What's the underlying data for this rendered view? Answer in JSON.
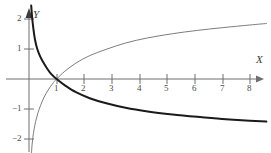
{
  "figure": {
    "background": "#ffffff",
    "x_axis_name": "X",
    "y_axis_name": "Y"
  },
  "chart_data": {
    "type": "line",
    "title": "",
    "xlabel": "X",
    "ylabel": "Y",
    "xlim": [
      -0.15,
      8.8
    ],
    "ylim": [
      -2.6,
      2.4
    ],
    "grid": false,
    "legend": null,
    "axis_arrows": [
      "x-positive",
      "y-positive"
    ],
    "x_ticks": [
      1,
      2,
      3,
      4,
      5,
      6,
      7,
      8
    ],
    "x_tick_labels": [
      "1",
      "2",
      "3",
      "4",
      "5",
      "6",
      "7",
      "8"
    ],
    "y_ticks": [
      -2,
      -1,
      1,
      2
    ],
    "y_tick_labels": [
      "−2",
      "−1",
      "1",
      "2"
    ],
    "series": [
      {
        "name": "decreasing-logarithm",
        "color": "#1a1a1a",
        "width": 2.0,
        "note": "thick black curve, decreasing, passes through (1,0)",
        "x": [
          0.08,
          0.1,
          0.13,
          0.17,
          0.22,
          0.3,
          0.4,
          0.5,
          0.65,
          0.8,
          1.0,
          1.3,
          1.7,
          2.2,
          2.8,
          3.5,
          4.3,
          5.2,
          6.1,
          7.0,
          8.0,
          8.6
        ],
        "y": [
          2.45,
          2.2,
          1.9,
          1.6,
          1.3,
          1.0,
          0.76,
          0.58,
          0.36,
          0.17,
          0.0,
          -0.21,
          -0.44,
          -0.64,
          -0.81,
          -0.96,
          -1.08,
          -1.18,
          -1.26,
          -1.33,
          -1.39,
          -1.42
        ]
      },
      {
        "name": "increasing-logarithm",
        "color": "#6e6e6e",
        "width": 0.9,
        "note": "thin gray curve, increasing, passes through (1,0)",
        "x": [
          0.09,
          0.11,
          0.14,
          0.18,
          0.24,
          0.32,
          0.42,
          0.55,
          0.7,
          0.85,
          1.0,
          1.3,
          1.7,
          2.2,
          2.8,
          3.5,
          4.3,
          5.2,
          6.1,
          7.0,
          8.0,
          8.6
        ],
        "y": [
          -2.45,
          -2.2,
          -1.95,
          -1.7,
          -1.42,
          -1.14,
          -0.88,
          -0.6,
          -0.36,
          -0.16,
          0.0,
          0.26,
          0.53,
          0.78,
          0.99,
          1.2,
          1.37,
          1.51,
          1.62,
          1.71,
          1.8,
          1.85
        ]
      }
    ]
  }
}
